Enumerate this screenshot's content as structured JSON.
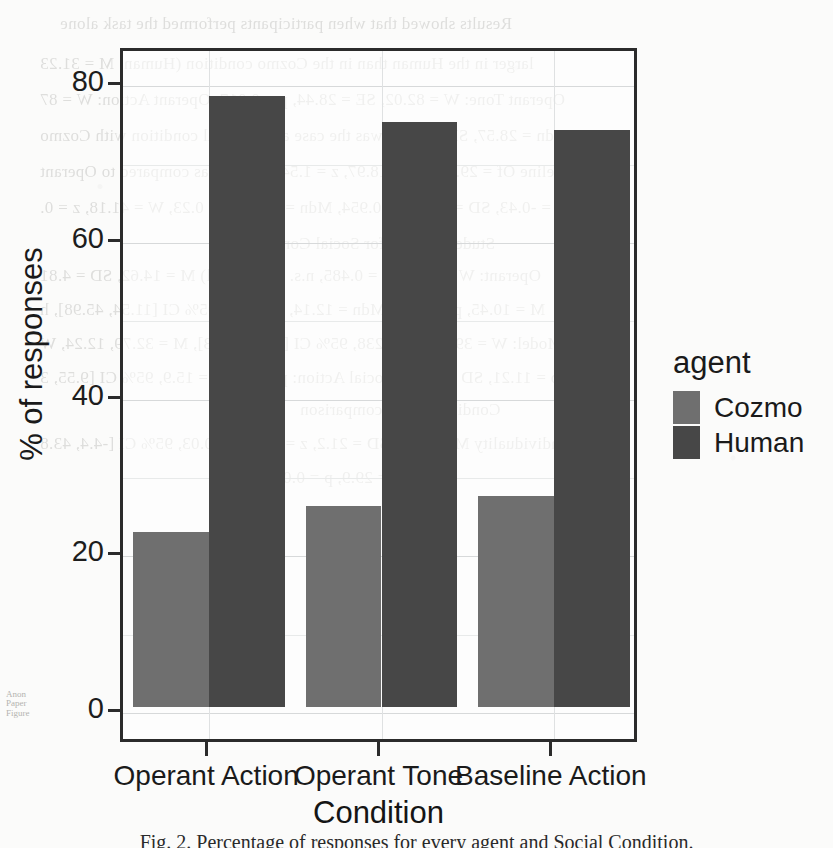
{
  "figure": {
    "caption": "Fig. 2. Percentage of responses for every agent and Social Condition."
  },
  "chart_data": {
    "type": "bar",
    "title": "",
    "xlabel": "Condition",
    "ylabel": "% of responses",
    "categories": [
      "Operant Action",
      "Operant Tone",
      "Baseline Action"
    ],
    "series": [
      {
        "name": "Cozmo",
        "color": "#6f6f6f",
        "values": [
          22.3,
          25.7,
          27.0
        ]
      },
      {
        "name": "Human",
        "color": "#474747",
        "values": [
          78.0,
          74.7,
          73.7
        ]
      }
    ],
    "legend": {
      "title": "agent",
      "position": "right",
      "entries": [
        "Cozmo",
        "Human"
      ]
    },
    "ylim": [
      0,
      84
    ],
    "yticks": [
      0,
      20,
      40,
      60,
      80
    ],
    "ytick_labels": [
      "0",
      "20",
      "40",
      "60",
      "80"
    ],
    "grid": true,
    "grid_minor": [
      10,
      30,
      50,
      70
    ]
  },
  "background_text": {
    "note": "faint mirrored bleed-through text from the reverse side of the scanned page",
    "lines": [
      "Results showed that when participants performed the task alone",
      "larger in the Human than in the Cozmo condition (Human: M = 31.23",
      "Operant Tone: W = 82.02, SE = 28.44, p = 0.017; Operant Action: W = 87",
      "Mdn = 28.57, SD = 15.21 was the case as the social condition with Cozmo",
      "Baseline Of = 29.16, SD = 18.97, z = 1.54, p = 0.09 as compared to Operant",
      "Mdn = -0.43, SD = 6.51, p = 0.954, Mdn = 19.99, p = 0.23, W = 41.18, z = 0.",
      "Student Scores for Social Condition",
      "Operant: W = 73.64, p = 0.485, n.s. (Individual) M = 14.62, SD = 4.81",
      "M = 10.45, p = 0.825, Mdn = 12.14, p = 0.03, 95% CI [11.54, 45.98], h",
      "Model: W = 39.11, p = 0.238, 95% CI [7.84, 41.33], M = 32.79, 12.24, W",
      "p = 11.21, SD = 12.71, Social Action: p = 32, SE = 15.9, 95% CI [9.55, 3",
      "Condition alone comparison",
      "Individuality M = -36.4, SD = 21.2, z = 2.16, p = 0.03, 95% CI [-4.4, 43.8",
      "SD = 29.9, p = 0.07, n.s."
    ],
    "margin_stamp": [
      "Anon",
      "Paper",
      "Figure"
    ]
  }
}
